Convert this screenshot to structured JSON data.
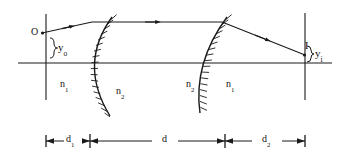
{
  "figure": {
    "type": "optics-ray-diagram",
    "stroke_color": "#1a1a1a",
    "background_color": "#ffffff"
  },
  "points": {
    "object": {
      "label": "O",
      "x": 42,
      "y": 33
    },
    "image": {
      "label": "I",
      "x": 305,
      "y": 55
    }
  },
  "heights": {
    "object_height": {
      "symbol": "y",
      "subscript": "o"
    },
    "image_height": {
      "symbol": "y",
      "subscript": "i"
    }
  },
  "indices": {
    "left_outer": {
      "symbol": "n",
      "subscript": "1"
    },
    "left_inner": {
      "symbol": "n",
      "subscript": "2"
    },
    "right_inner": {
      "symbol": "n",
      "subscript": "2"
    },
    "right_outer": {
      "symbol": "n",
      "subscript": "1"
    }
  },
  "dimensions": [
    {
      "symbol": "d",
      "subscript": "1",
      "from_x": 46,
      "to_x": 90
    },
    {
      "symbol": "d",
      "subscript": "",
      "from_x": 90,
      "to_x": 225
    },
    {
      "symbol": "d",
      "subscript": "2",
      "from_x": 225,
      "to_x": 305
    }
  ],
  "axes": {
    "optical_axis_y": 63,
    "optical_axis_from_x": 18,
    "optical_axis_to_x": 332,
    "object_plane_x": 46,
    "image_plane_x": 305
  },
  "surfaces": [
    {
      "name": "first-refracting-surface",
      "vertex_x": 90,
      "bulge": "left",
      "hatch_side": "left"
    },
    {
      "name": "second-refracting-surface",
      "vertex_x": 225,
      "bulge": "left",
      "hatch_side": "left"
    }
  ],
  "rays": [
    {
      "name": "incident-ray",
      "from": [
        42,
        33
      ],
      "to": [
        92,
        22
      ],
      "arrow_at": 0.55
    },
    {
      "name": "internal-ray",
      "from": [
        92,
        22
      ],
      "to": [
        222,
        22
      ],
      "arrow_at": 0.55
    },
    {
      "name": "emergent-ray",
      "from": [
        222,
        22
      ],
      "to": [
        305,
        55
      ],
      "arrow_at": 0.58
    }
  ]
}
